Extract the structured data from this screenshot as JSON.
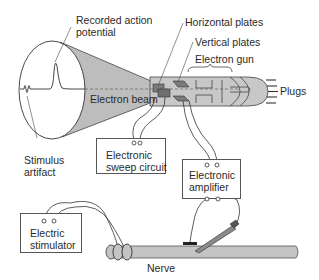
{
  "diagram": {
    "labels": {
      "recorded_action_potential_line1": "Recorded action",
      "recorded_action_potential_line2": "potential",
      "horizontal_plates": "Horizontal plates",
      "vertical_plates": "Vertical plates",
      "electron_gun": "Electron gun",
      "plugs": "Plugs",
      "electron_beam": "Electron beam",
      "stimulus_artifact_line1": "Stimulus",
      "stimulus_artifact_line2": "artifact",
      "nerve": "Nerve"
    },
    "boxes": {
      "sweep_circuit": {
        "line1": "Electronic",
        "line2": "sweep circuit"
      },
      "amplifier": {
        "line1": "Electronic",
        "line2": "amplifier"
      },
      "stimulator": {
        "line1": "Electric",
        "line2": "stimulator"
      }
    },
    "colors": {
      "tube_fill": "#c8c8c8",
      "cone_fill": "#bdbdbd",
      "plate_fill": "#7a7a7a",
      "line": "#333333",
      "nerve_fill": "#c4c4c4"
    }
  }
}
